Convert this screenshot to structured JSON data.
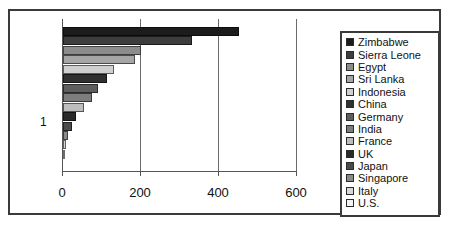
{
  "chart_data": {
    "type": "bar",
    "orientation": "horizontal",
    "title": "",
    "xlabel": "",
    "ylabel": "",
    "grid": true,
    "legend_position": "right",
    "xlim": [
      0,
      600
    ],
    "xticks": [
      0,
      200,
      400,
      600
    ],
    "xtick_labels": [
      "0",
      "200",
      "400",
      "600"
    ],
    "categories": [
      "1"
    ],
    "ytick_labels": [
      "1"
    ],
    "series": [
      {
        "name": "Zimbabwe",
        "values": [
          450
        ],
        "color": "#1c1c1c"
      },
      {
        "name": "Sierra Leone",
        "values": [
          332
        ],
        "color": "#3d3d3d"
      },
      {
        "name": "Egypt",
        "values": [
          200
        ],
        "color": "#8c8c8c"
      },
      {
        "name": "Sri Lanka",
        "values": [
          185
        ],
        "color": "#a6a6a6"
      },
      {
        "name": "Indonesia",
        "values": [
          132
        ],
        "color": "#cfcfcf"
      },
      {
        "name": "China",
        "values": [
          112
        ],
        "color": "#303030"
      },
      {
        "name": "Germany",
        "values": [
          90
        ],
        "color": "#5e5e5e"
      },
      {
        "name": "India",
        "values": [
          74
        ],
        "color": "#7d7d7d"
      },
      {
        "name": "France",
        "values": [
          55
        ],
        "color": "#bdbdbd"
      },
      {
        "name": "UK",
        "values": [
          34
        ],
        "color": "#2a2a2a"
      },
      {
        "name": "Japan",
        "values": [
          24
        ],
        "color": "#4a4a4a"
      },
      {
        "name": "Singapore",
        "values": [
          14
        ],
        "color": "#8a8a8a"
      },
      {
        "name": "Italy",
        "values": [
          8
        ],
        "color": "#d8d8d8"
      },
      {
        "name": "U.S.",
        "values": [
          4
        ],
        "color": "#f2f2f2"
      }
    ]
  },
  "legend": {
    "items": [
      {
        "label": "Zimbabwe",
        "color": "#1c1c1c"
      },
      {
        "label": "Sierra Leone",
        "color": "#3d3d3d"
      },
      {
        "label": "Egypt",
        "color": "#8c8c8c"
      },
      {
        "label": "Sri Lanka",
        "color": "#a6a6a6"
      },
      {
        "label": "Indonesia",
        "color": "#cfcfcf"
      },
      {
        "label": "China",
        "color": "#303030"
      },
      {
        "label": "Germany",
        "color": "#5e5e5e"
      },
      {
        "label": "India",
        "color": "#7d7d7d"
      },
      {
        "label": "France",
        "color": "#bdbdbd"
      },
      {
        "label": "UK",
        "color": "#2a2a2a"
      },
      {
        "label": "Japan",
        "color": "#4a4a4a"
      },
      {
        "label": "Singapore",
        "color": "#8a8a8a"
      },
      {
        "label": "Italy",
        "color": "#d8d8d8"
      },
      {
        "label": "U.S.",
        "color": "#f2f2f2"
      }
    ]
  }
}
